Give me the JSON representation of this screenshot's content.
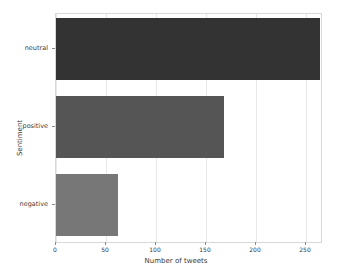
{
  "chart_data": {
    "type": "bar",
    "orientation": "horizontal",
    "title": "",
    "xlabel": "Number of tweets",
    "ylabel": "Sentiment",
    "categories": [
      "neutral",
      "positive",
      "negative"
    ],
    "values": [
      264,
      168,
      62
    ],
    "series": [
      {
        "name": "Number of tweets",
        "values": [
          264,
          168,
          62
        ]
      }
    ],
    "bars": [
      {
        "category": "neutral",
        "value": 264,
        "color": "#333333"
      },
      {
        "category": "positive",
        "value": 168,
        "color": "#555555"
      },
      {
        "category": "negative",
        "value": 62,
        "color": "#777777"
      }
    ],
    "xlim": [
      0,
      265
    ],
    "ylim": [
      0,
      3
    ],
    "xticks": [
      0,
      50,
      100,
      150,
      200,
      250
    ],
    "xtick_labels": [
      "0",
      "50",
      "100",
      "150",
      "200",
      "250"
    ],
    "ytick_labels": [
      "neutral",
      "positive",
      "negative"
    ],
    "grid": true,
    "grid_axis": "x",
    "grid_color": "#e8e8e8",
    "legend": false,
    "legend_position": "none",
    "background_color": "#ffffff",
    "axes_edge_color": "#d8d8d8"
  }
}
